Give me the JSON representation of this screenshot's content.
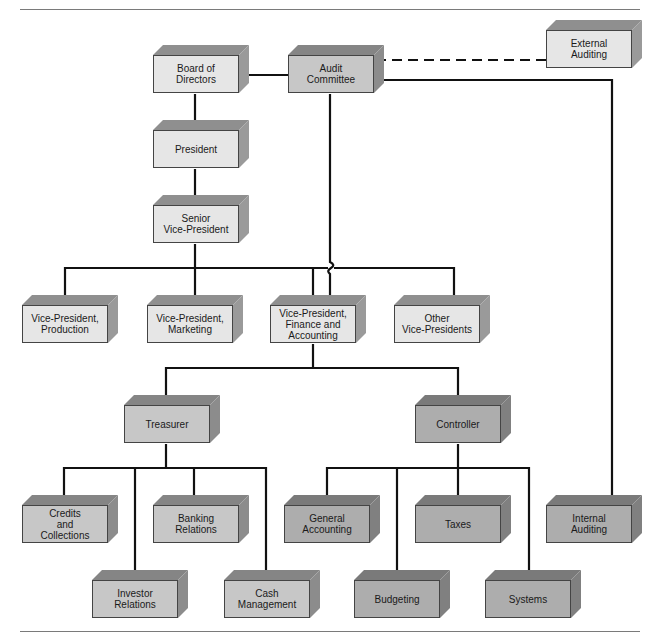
{
  "diagram": {
    "colors": {
      "line": "#111111",
      "light_face": "#e6e6e6",
      "mid_face": "#c7c7c7",
      "dark_face": "#adadad"
    },
    "nodes": [
      {
        "id": "board",
        "label": "Board of\nDirectors",
        "shade": "light",
        "x": 153,
        "y": 55
      },
      {
        "id": "audit",
        "label": "Audit\nCommittee",
        "shade": "mid",
        "x": 288,
        "y": 55
      },
      {
        "id": "external",
        "label": "External\nAuditing",
        "shade": "light",
        "x": 546,
        "y": 30
      },
      {
        "id": "president",
        "label": "President",
        "shade": "light",
        "x": 153,
        "y": 130
      },
      {
        "id": "svp",
        "label": "Senior\nVice-President",
        "shade": "light",
        "x": 153,
        "y": 205
      },
      {
        "id": "vp_prod",
        "label": "Vice-President,\nProduction",
        "shade": "light",
        "x": 22,
        "y": 305
      },
      {
        "id": "vp_mkt",
        "label": "Vice-President,\nMarketing",
        "shade": "light",
        "x": 147,
        "y": 305
      },
      {
        "id": "vp_fin",
        "label": "Vice-President,\nFinance and\nAccounting",
        "shade": "light",
        "x": 270,
        "y": 305
      },
      {
        "id": "vp_other",
        "label": "Other\nVice-Presidents",
        "shade": "light",
        "x": 394,
        "y": 305
      },
      {
        "id": "treasurer",
        "label": "Treasurer",
        "shade": "mid",
        "x": 124,
        "y": 405
      },
      {
        "id": "controller",
        "label": "Controller",
        "shade": "dark",
        "x": 415,
        "y": 405
      },
      {
        "id": "credits",
        "label": "Credits\nand\nCollections",
        "shade": "mid",
        "x": 22,
        "y": 505
      },
      {
        "id": "banking",
        "label": "Banking\nRelations",
        "shade": "mid",
        "x": 153,
        "y": 505
      },
      {
        "id": "gen_acct",
        "label": "General\nAccounting",
        "shade": "dark",
        "x": 284,
        "y": 505
      },
      {
        "id": "taxes",
        "label": "Taxes",
        "shade": "dark",
        "x": 415,
        "y": 505
      },
      {
        "id": "internal",
        "label": "Internal\nAuditing",
        "shade": "dark",
        "x": 546,
        "y": 505
      },
      {
        "id": "investor",
        "label": "Investor\nRelations",
        "shade": "mid",
        "x": 92,
        "y": 580
      },
      {
        "id": "cash",
        "label": "Cash\nManagement",
        "shade": "mid",
        "x": 224,
        "y": 580
      },
      {
        "id": "budgeting",
        "label": "Budgeting",
        "shade": "dark",
        "x": 354,
        "y": 580
      },
      {
        "id": "systems",
        "label": "Systems",
        "shade": "dark",
        "x": 485,
        "y": 580
      }
    ],
    "edges": [
      {
        "from": "board",
        "to": "audit",
        "style": "solid"
      },
      {
        "from": "audit",
        "to": "external",
        "style": "dashed"
      },
      {
        "from": "audit",
        "to": "internal",
        "style": "solid"
      },
      {
        "from": "audit",
        "to": "vp_fin",
        "style": "solid"
      },
      {
        "from": "board",
        "to": "president",
        "style": "solid"
      },
      {
        "from": "president",
        "to": "svp",
        "style": "solid"
      },
      {
        "from": "svp",
        "to": "vp_prod",
        "style": "solid"
      },
      {
        "from": "svp",
        "to": "vp_mkt",
        "style": "solid"
      },
      {
        "from": "svp",
        "to": "vp_fin",
        "style": "solid"
      },
      {
        "from": "svp",
        "to": "vp_other",
        "style": "solid"
      },
      {
        "from": "vp_fin",
        "to": "treasurer",
        "style": "solid"
      },
      {
        "from": "vp_fin",
        "to": "controller",
        "style": "solid"
      },
      {
        "from": "treasurer",
        "to": "credits",
        "style": "solid"
      },
      {
        "from": "treasurer",
        "to": "banking",
        "style": "solid"
      },
      {
        "from": "treasurer",
        "to": "investor",
        "style": "solid"
      },
      {
        "from": "treasurer",
        "to": "cash",
        "style": "solid"
      },
      {
        "from": "controller",
        "to": "gen_acct",
        "style": "solid"
      },
      {
        "from": "controller",
        "to": "taxes",
        "style": "solid"
      },
      {
        "from": "controller",
        "to": "budgeting",
        "style": "solid"
      },
      {
        "from": "controller",
        "to": "systems",
        "style": "solid"
      }
    ]
  }
}
